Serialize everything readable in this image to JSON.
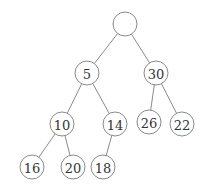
{
  "diagram": {
    "type": "binary-tree",
    "radius": 12,
    "nodes": [
      {
        "id": "root",
        "label": "",
        "x": 125,
        "y": 24
      },
      {
        "id": "n5",
        "label": "5",
        "x": 87,
        "y": 73
      },
      {
        "id": "n30",
        "label": "30",
        "x": 156,
        "y": 73
      },
      {
        "id": "n10",
        "label": "10",
        "x": 62,
        "y": 124
      },
      {
        "id": "n14",
        "label": "14",
        "x": 115,
        "y": 124
      },
      {
        "id": "n26",
        "label": "26",
        "x": 149,
        "y": 122
      },
      {
        "id": "n22",
        "label": "22",
        "x": 182,
        "y": 124
      },
      {
        "id": "n16",
        "label": "16",
        "x": 32,
        "y": 167
      },
      {
        "id": "n20",
        "label": "20",
        "x": 73,
        "y": 167
      },
      {
        "id": "n18",
        "label": "18",
        "x": 103,
        "y": 167
      }
    ],
    "edges": [
      {
        "from": "root",
        "to": "n5"
      },
      {
        "from": "root",
        "to": "n30"
      },
      {
        "from": "n5",
        "to": "n10"
      },
      {
        "from": "n5",
        "to": "n14"
      },
      {
        "from": "n30",
        "to": "n26"
      },
      {
        "from": "n30",
        "to": "n22"
      },
      {
        "from": "n10",
        "to": "n16"
      },
      {
        "from": "n10",
        "to": "n20"
      },
      {
        "from": "n14",
        "to": "n18"
      }
    ]
  }
}
